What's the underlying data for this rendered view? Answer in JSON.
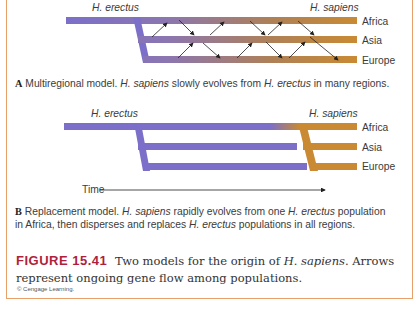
{
  "panel_a": {
    "label_left": "H. erectus",
    "label_right": "H. sapiens",
    "regions": [
      "Africa",
      "Asia",
      "Europe"
    ],
    "caption_letter": "A",
    "caption_text_1": " Multiregional model. ",
    "caption_italic_1": "H. sapiens",
    "caption_text_2": " slowly evolves from ",
    "caption_italic_2": "H. erectus",
    "caption_text_3": " in many regions."
  },
  "panel_b": {
    "label_left": "H. erectus",
    "label_right": "H. sapiens",
    "regions": [
      "Africa",
      "Asia",
      "Europe"
    ],
    "time_label": "Time",
    "caption_letter": "B",
    "caption_line1_a": " Replacement model. ",
    "caption_line1_i1": "H. sapiens",
    "caption_line1_b": " rapidly evolves from one ",
    "caption_line1_i2": "H. erectus",
    "caption_line1_c": " population",
    "caption_line2_a": "in Africa, then disperses and replaces ",
    "caption_line2_i": "H. erectus",
    "caption_line2_b": " populations in all regions."
  },
  "figure": {
    "number": "FIGURE 15.41",
    "text_1": "Two models for the origin of ",
    "italic": "H. sapiens",
    "text_2": ". Arrows represent ongoing gene flow among populations.",
    "credit": "© Cengage Learning."
  },
  "colors": {
    "erectus": "#7b6fc9",
    "sapiens": "#c98a33",
    "border": "#e7a06a",
    "figure_number": "#b01e3a"
  },
  "footer_fragment": "Th..."
}
